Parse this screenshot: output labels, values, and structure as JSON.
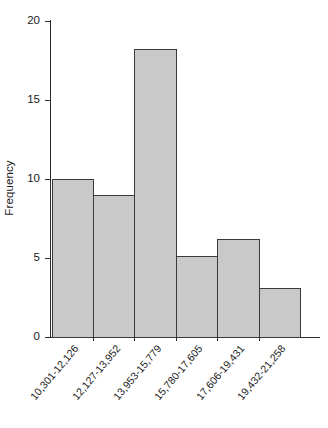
{
  "chart_data": {
    "type": "bar",
    "title": "",
    "subtitle": "",
    "xlabel": "",
    "ylabel": "Frequency",
    "categories": [
      "10,301-12,126",
      "12,127-13,952",
      "13,953-15,779",
      "15,780-17,605",
      "17,606-19,431",
      "19,432-21,258"
    ],
    "values": [
      10,
      9,
      18.2,
      5.1,
      6.2,
      3.1
    ],
    "ylim": [
      0,
      20
    ],
    "yticks": [
      0,
      5,
      10,
      15,
      20
    ],
    "ytick_labels": [
      "0",
      "5",
      "10",
      "15",
      "20"
    ],
    "grid": false,
    "legend": false,
    "legend_position": "none",
    "bar_fill_color": "#c9c9c9",
    "bar_edge_color": "#3a3a3a",
    "axis_color": "#2b2b2b",
    "background_color": "#ffffff",
    "orientation": "vertical"
  }
}
